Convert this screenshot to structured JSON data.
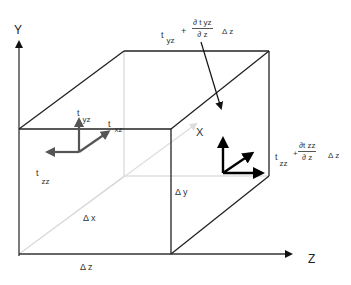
{
  "diagram": {
    "axes": {
      "y": "Y",
      "z": "Z",
      "x": "X"
    },
    "dimensions": {
      "dx": "Δ x",
      "dy": "Δ y",
      "dz": "Δ z"
    },
    "near_face": {
      "t_yz": {
        "t": "t",
        "sub": "yz"
      },
      "t_xz": {
        "t": "t",
        "sub": "xz"
      },
      "t_zz": {
        "t": "t",
        "sub": "zz"
      }
    },
    "far_face": {
      "yz_expr": {
        "t": "t",
        "sub": "yz",
        "plus": "+",
        "num": "∂ t  yz",
        "den": "∂ z",
        "dz": "Δ z"
      },
      "zz_expr": {
        "t": "t",
        "sub": "zz",
        "plus": "+",
        "num": "∂t  zz",
        "den": "∂ z",
        "dz": "Δ z"
      }
    },
    "colors": {
      "edge": "#222222",
      "hidden": "#c8c8c8",
      "vec_near": "#555555",
      "vec_far": "#000000"
    }
  }
}
